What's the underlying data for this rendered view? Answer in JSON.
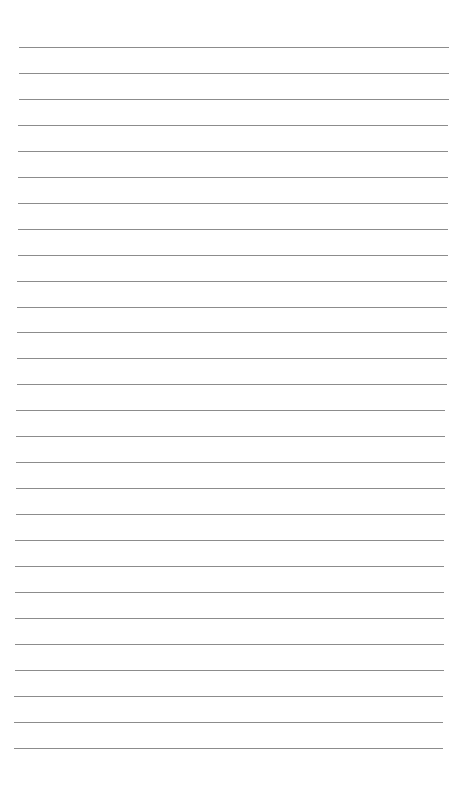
{
  "page": {
    "type": "lined-paper",
    "background": "#ffffff",
    "line_color": "#8c8c8c",
    "line_count": 28,
    "first_line_y": 47,
    "line_spacing": 25.95,
    "line_left_start": 19,
    "line_right_start": 449,
    "line_left_end": 14,
    "line_right_end": 443,
    "text": ""
  }
}
